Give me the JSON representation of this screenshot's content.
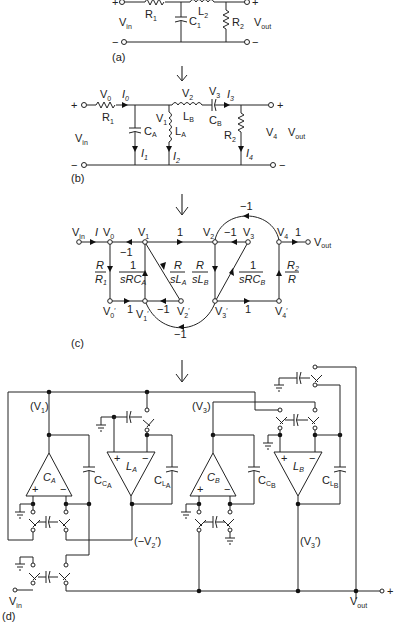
{
  "figure": {
    "panel_a": {
      "label": "(a)",
      "components": {
        "R1": "R",
        "R1_sub": "1",
        "C1": "C",
        "C1_sub": "1",
        "L2": "L",
        "L2_sub": "2",
        "R2": "R",
        "R2_sub": "2"
      },
      "input": {
        "plus": "+",
        "minus": "−",
        "vin": "V",
        "vin_sub": "in"
      },
      "output": {
        "plus": "+",
        "minus": "−",
        "vout": "V",
        "vout_sub": "out"
      }
    },
    "panel_b": {
      "label": "(b)",
      "nodes": {
        "V0": "V",
        "V0_sub": "0",
        "V1": "V",
        "V1_sub": "1",
        "V2": "V",
        "V2_sub": "2",
        "V3": "V",
        "V3_sub": "3",
        "V4": "V",
        "V4_sub": "4"
      },
      "currents": {
        "I0": "I",
        "I0_sub": "0",
        "I1": "I",
        "I1_sub": "1",
        "I2": "I",
        "I2_sub": "2",
        "I3": "I",
        "I3_sub": "3",
        "I4": "I",
        "I4_sub": "4"
      },
      "components": {
        "R1": "R",
        "R1_sub": "1",
        "CA": "C",
        "CA_sub": "A",
        "LA": "L",
        "LA_sub": "A",
        "LB": "L",
        "LB_sub": "B",
        "CB": "C",
        "CB_sub": "B",
        "R2": "R",
        "R2_sub": "2"
      },
      "input": {
        "plus": "+",
        "minus": "−",
        "vin": "V",
        "vin_sub": "in"
      },
      "output": {
        "plus": "+",
        "minus": "−",
        "vout": "V",
        "vout_sub": "out"
      }
    },
    "panel_c": {
      "label": "(c)",
      "nodes_top": [
        {
          "name": "V",
          "sub": "in"
        },
        {
          "name": "V",
          "sub": "0"
        },
        {
          "name": "V",
          "sub": "1"
        },
        {
          "name": "V",
          "sub": "2"
        },
        {
          "name": "V",
          "sub": "3"
        },
        {
          "name": "V",
          "sub": "4"
        }
      ],
      "nodes_bottom": [
        {
          "name": "V",
          "sub": "0",
          "prime": "′"
        },
        {
          "name": "V",
          "sub": "1",
          "prime": "′"
        },
        {
          "name": "V",
          "sub": "2",
          "prime": "′"
        },
        {
          "name": "V",
          "sub": "3",
          "prime": "′"
        },
        {
          "name": "V",
          "sub": "4",
          "prime": "′"
        }
      ],
      "gains": {
        "I": "I",
        "v1_v0": "−1",
        "v1_v2": "1",
        "v3_v2": "−1",
        "v4_out": "1",
        "vout": "V",
        "vout_sub": "out",
        "v4_v2_arc": "−1",
        "r_r1_num": "R",
        "r_r1_den": "R",
        "r_r1_den_sub": "1",
        "src_num": "1",
        "src_den": "sRC",
        "src_den_sub": "A",
        "rsla_num": "R",
        "rsla_den": "sL",
        "rsla_den_sub": "A",
        "rslb_num": "R",
        "rslb_den": "sL",
        "rslb_den_sub": "B",
        "srcb_num": "1",
        "srcb_den": "sRC",
        "srcb_den_sub": "B",
        "r2r_num": "R",
        "r2r_num_sub": "2",
        "r2r_den": "R",
        "v0p_v1p": "1",
        "v2p_v1p": "−1",
        "v3p_v4p": "1",
        "v3p_v1p_arc": "−1"
      }
    },
    "panel_d": {
      "label": "(d)",
      "opamps": [
        {
          "name": "C",
          "sub": "A",
          "plus": "+",
          "minus": "−"
        },
        {
          "name": "L",
          "sub": "A",
          "plus": "+",
          "minus": "−"
        },
        {
          "name": "C",
          "sub": "B",
          "plus": "+",
          "minus": "−"
        },
        {
          "name": "L",
          "sub": "B",
          "plus": "+",
          "minus": "−"
        }
      ],
      "caps": [
        {
          "name": "C",
          "sub": "C",
          "subsub": "A"
        },
        {
          "name": "C",
          "sub": "L",
          "subsub": "A"
        },
        {
          "name": "C",
          "sub": "C",
          "subsub": "B"
        },
        {
          "name": "C",
          "sub": "L",
          "subsub": "B"
        }
      ],
      "node_labels": {
        "v1": "(V",
        "v1_sub": "1",
        "v1_close": ")",
        "v3": "(V",
        "v3_sub": "3",
        "v3_close": ")",
        "mv2p": "(−V",
        "mv2p_sub": "2",
        "mv2p_close": "′)",
        "v3p": "(V",
        "v3p_sub": "3",
        "v3p_close": "′)"
      },
      "vin": "V",
      "vin_sub": "in",
      "vout": "V",
      "vout_sub": "out",
      "out_plus": "+"
    },
    "arrows": [
      "down-arrow",
      "down-arrow",
      "down-arrow"
    ]
  }
}
